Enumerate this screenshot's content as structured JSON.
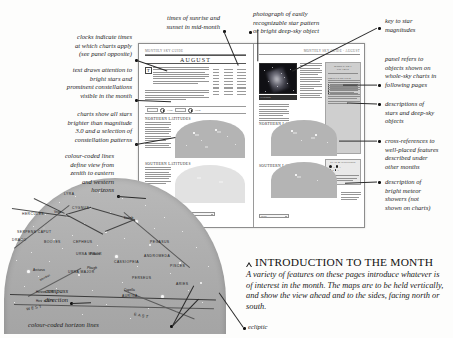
{
  "annotations": {
    "clocks": "clocks indicate times\nat which charts apply\n(see panel opposite)",
    "text_draws": "text draws attention to\nbright stars and\nprominent constellations\nvisible in the month",
    "charts_show": "charts show all stars\nbrighter than magnitude\n3.0 and a selection of\nconstellation patterns",
    "colour_lines": "colour-coded lines\ndefine view from\nzenith to eastern\nand western\nhorizons",
    "compass": "compass\ndirection",
    "horizon_lines": "colour-coded horizon lines",
    "sunrise": "times of sunrise and\nsunset in mid-month",
    "photograph": "photograph of easily\nrecognizable star pattern\nor bright deep-sky object",
    "key_to_star": "key to star\nmagnitudes",
    "panel_refers": "panel refers to\nobjects shown on\nwhole-sky charts in\nfollowing pages",
    "descriptions": "descriptions of\nstars and deep-sky\nobjects",
    "cross_refs": "cross-references to\nwell-placed features\ndescribed under\nother months",
    "meteor": "description of\nbright meteor\nshowers (not\nshown on charts)",
    "ecliptic": "ecliptic"
  },
  "spread": {
    "left_page": {
      "runhead": "MONTHLY SKY GUIDE",
      "month_title": "August",
      "dropcap": "T",
      "sun_table": {
        "headers": [
          "Date",
          "Sunrise",
          "Sunset"
        ]
      },
      "section_north": "NORTHERN LATITUDES",
      "section_south": "SOUTHERN LATITUDES",
      "clock_labels": [
        "11pm",
        "10pm",
        "midnight"
      ]
    },
    "right_page": {
      "runhead": "MONTHLY SKY GUIDE · AUGUST",
      "photo_caption": "CYGNUS",
      "panel_title": "WHOLE-SKY CHARTS",
      "panel_sub": "OBJECTS ON VIEW",
      "magkey_title": "STAR MAGNITUDES",
      "magkey_rows": [
        "0",
        "1",
        "2",
        "3",
        "4"
      ],
      "selector_labels": [
        "Month",
        "Latitude"
      ]
    }
  },
  "big_chart": {
    "constellations": [
      "HERCULES",
      "LYRA",
      "CYGNUS",
      "DRACO",
      "CEPHEUS",
      "SERPENS CAPUT",
      "BOOTES",
      "URSA MINOR",
      "URSA MAJOR",
      "CASSIOPEIA",
      "PEGASUS",
      "ANDROMEDA",
      "PERSEUS",
      "AURIGA",
      "ARIES",
      "PISCES"
    ],
    "stars": [
      "Vega",
      "Deneb",
      "Polaris",
      "Arcturus",
      "Capella"
    ],
    "asterism": "Plough",
    "horizon_labels": [
      "Horizon 45°N",
      "Horizon 30°N"
    ],
    "compass": [
      "WEST",
      "EAST"
    ],
    "meridian": "Meridian"
  },
  "intro": {
    "symbol": "triangle-bullet",
    "title_caps": "I",
    "title": "NTRODUCTION TO THE ",
    "title_word2": "M",
    "title_tail": "ONTH",
    "title_full": "INTRODUCTION TO THE MONTH",
    "body": "A variety of features on these pages introduce whatever is of interest in the month. The maps are to be held vertically, and show the view ahead and to the sides, facing north or south."
  }
}
